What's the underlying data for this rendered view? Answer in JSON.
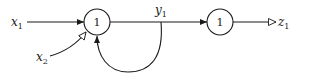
{
  "diagram": {
    "type": "neural network / signal flow graph",
    "nodes": [
      {
        "id": "n1",
        "label": "1"
      },
      {
        "id": "n2",
        "label": "1"
      }
    ],
    "inputs": [
      {
        "id": "x1",
        "name": "x",
        "subscript": "1",
        "target": "n1",
        "arrow": "filled"
      },
      {
        "id": "x2",
        "name": "x",
        "subscript": "2",
        "target": "n1",
        "arrow": "hollow"
      }
    ],
    "signals": [
      {
        "id": "y1",
        "name": "y",
        "subscript": "1",
        "source": "n1",
        "target": "n2",
        "arrow": "filled"
      }
    ],
    "feedback": [
      {
        "source": "y1",
        "target": "n1",
        "arrow": "filled"
      }
    ],
    "outputs": [
      {
        "id": "z1",
        "name": "z",
        "subscript": "1",
        "source": "n2",
        "arrow": "hollow"
      }
    ],
    "colors": {
      "stroke": "#1a1a1a",
      "background": "#ffffff"
    }
  }
}
